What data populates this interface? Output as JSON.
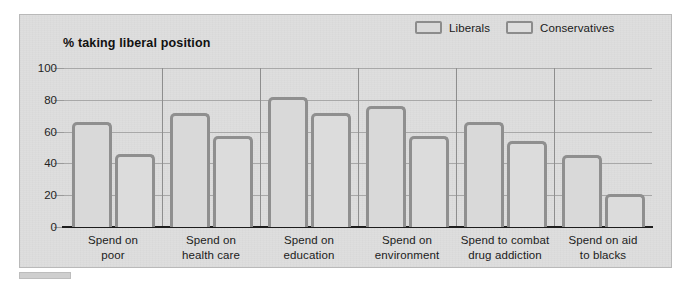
{
  "chart_data": {
    "type": "bar",
    "title": "% taking liberal position",
    "xlabel": "",
    "ylabel": "% taking liberal position",
    "ylim": [
      0,
      100
    ],
    "yticks": [
      0,
      20,
      40,
      60,
      80,
      100
    ],
    "grid": true,
    "legend_position": "top-right",
    "categories": [
      "Spend on poor",
      "Spend on health care",
      "Spend on education",
      "Spend on environment",
      "Spend to combat drug addiction",
      "Spend on aid to blacks"
    ],
    "category_lines": [
      [
        "Spend on",
        "poor"
      ],
      [
        "Spend on",
        "health care"
      ],
      [
        "Spend on",
        "education"
      ],
      [
        "Spend on",
        "environment"
      ],
      [
        "Spend to combat",
        "drug addiction"
      ],
      [
        "Spend on aid",
        "to blacks"
      ]
    ],
    "series": [
      {
        "name": "Liberals",
        "values": [
          66,
          72,
          82,
          76,
          66,
          45
        ]
      },
      {
        "name": "Conservatives",
        "values": [
          46,
          57,
          72,
          57,
          54,
          21
        ]
      }
    ]
  },
  "colors": {
    "panel_background": "#dedede",
    "bar_fill": "#d9d9d9",
    "bar_border": "#8f8f8f",
    "gridline": "#a8a8a8",
    "axis": "#1d1d1d",
    "text": "#1a1a1a"
  },
  "legend": {
    "items": [
      {
        "label": "Liberals"
      },
      {
        "label": "Conservatives"
      }
    ]
  },
  "axis": {
    "y_tick_labels": [
      "100",
      "80",
      "60",
      "40",
      "20",
      "0"
    ]
  }
}
